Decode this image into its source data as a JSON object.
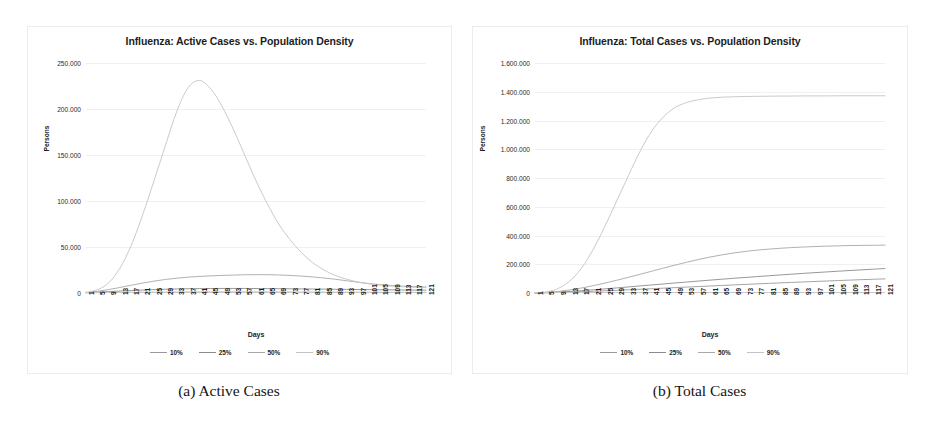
{
  "figure": {
    "panels": [
      {
        "caption": "(a) Active Cases",
        "title": "Influenza: Active Cases vs. Population Density",
        "xlabel": "Days",
        "ylabel": "Persons"
      },
      {
        "caption": "(b) Total Cases",
        "title": "Influenza: Total Cases vs. Population Density",
        "xlabel": "Days",
        "ylabel": "Persons"
      }
    ]
  },
  "legend": {
    "entries": [
      {
        "label": "10%",
        "color": "#9a9a9a"
      },
      {
        "label": "25%",
        "color": "#8c8c8c"
      },
      {
        "label": "50%",
        "color": "#a8a8a8"
      },
      {
        "label": "90%",
        "color": "#c4c4c4"
      }
    ]
  },
  "chart_data": [
    {
      "type": "line",
      "title": "Influenza: Active Cases vs. Population Density",
      "xlabel": "Days",
      "ylabel": "Persons",
      "grid": true,
      "legend_position": "bottom",
      "xlim": [
        1,
        121
      ],
      "ylim": [
        0,
        250000
      ],
      "yticks": [
        0,
        50000,
        100000,
        150000,
        200000,
        250000
      ],
      "ytick_labels": [
        "0",
        "50.000",
        "100.000",
        "150.000",
        "200.000",
        "250.000"
      ],
      "xtick_labels": [
        "1",
        "5",
        "9",
        "13",
        "17",
        "21",
        "25",
        "29",
        "33",
        "37",
        "41",
        "45",
        "49",
        "53",
        "57",
        "61",
        "65",
        "69",
        "73",
        "77",
        "81",
        "85",
        "89",
        "93",
        "97",
        "101",
        "105",
        "109",
        "113",
        "117",
        "121"
      ],
      "x": [
        1,
        5,
        9,
        13,
        17,
        21,
        25,
        29,
        33,
        37,
        41,
        45,
        49,
        53,
        57,
        61,
        65,
        69,
        73,
        77,
        81,
        85,
        89,
        93,
        97,
        101,
        105,
        109,
        113,
        117,
        121
      ],
      "series": [
        {
          "name": "10%",
          "color": "#9a9a9a",
          "values": [
            300,
            420,
            520,
            610,
            700,
            780,
            850,
            900,
            950,
            980,
            1000,
            1010,
            1020,
            1020,
            1015,
            1005,
            990,
            970,
            950,
            925,
            900,
            875,
            850,
            820,
            795,
            770,
            745,
            720,
            700,
            680,
            660
          ]
        },
        {
          "name": "25%",
          "color": "#8c8c8c",
          "values": [
            400,
            900,
            1500,
            2100,
            2700,
            3200,
            3700,
            4100,
            4400,
            4650,
            4800,
            4900,
            4950,
            4960,
            4930,
            4870,
            4790,
            4690,
            4580,
            4460,
            4330,
            4200,
            4060,
            3930,
            3800,
            3670,
            3540,
            3420,
            3300,
            3190,
            3080
          ]
        },
        {
          "name": "50%",
          "color": "#a8a8a8",
          "values": [
            500,
            1800,
            3700,
            6000,
            8500,
            10800,
            12900,
            14700,
            16100,
            17200,
            18000,
            18600,
            19100,
            19500,
            19800,
            19950,
            19900,
            19600,
            19100,
            18400,
            17500,
            16300,
            14900,
            13300,
            11700,
            10200,
            9000,
            8100,
            7400,
            6900,
            6500
          ]
        },
        {
          "name": "90%",
          "color": "#c4c4c4",
          "values": [
            800,
            3500,
            11000,
            27000,
            52000,
            85000,
            122000,
            160000,
            197000,
            223000,
            231000,
            222000,
            203000,
            178000,
            150000,
            122000,
            97000,
            75000,
            58000,
            44000,
            33000,
            25000,
            19000,
            15000,
            12000,
            10000,
            8500,
            7500,
            6800,
            6200,
            5800
          ]
        }
      ]
    },
    {
      "type": "line",
      "title": "Influenza: Total Cases vs. Population Density",
      "xlabel": "Days",
      "ylabel": "Persons",
      "grid": true,
      "legend_position": "bottom",
      "xlim": [
        1,
        121
      ],
      "ylim": [
        0,
        1600000
      ],
      "yticks": [
        0,
        200000,
        400000,
        600000,
        800000,
        1000000,
        1200000,
        1400000,
        1600000
      ],
      "ytick_labels": [
        "0",
        "200.000",
        "400.000",
        "600.000",
        "800.000",
        "1.000.000",
        "1.200.000",
        "1.400.000",
        "1.600.000"
      ],
      "xtick_labels": [
        "1",
        "5",
        "9",
        "13",
        "17",
        "21",
        "25",
        "29",
        "33",
        "37",
        "41",
        "45",
        "49",
        "53",
        "57",
        "61",
        "65",
        "69",
        "73",
        "77",
        "81",
        "85",
        "89",
        "93",
        "97",
        "101",
        "105",
        "109",
        "113",
        "117",
        "121"
      ],
      "x": [
        1,
        5,
        9,
        13,
        17,
        21,
        25,
        29,
        33,
        37,
        41,
        45,
        49,
        53,
        57,
        61,
        65,
        69,
        73,
        77,
        81,
        85,
        89,
        93,
        97,
        101,
        105,
        109,
        113,
        117,
        121
      ],
      "series": [
        {
          "name": "10%",
          "color": "#9a9a9a",
          "values": [
            300,
            1800,
            3800,
            6200,
            9000,
            12000,
            15300,
            18700,
            22300,
            26000,
            29700,
            33500,
            37300,
            41100,
            44900,
            48700,
            52400,
            56100,
            59700,
            63300,
            66800,
            70300,
            73700,
            77000,
            80300,
            83500,
            86600,
            89700,
            92700,
            95600,
            98500
          ]
        },
        {
          "name": "25%",
          "color": "#8c8c8c",
          "values": [
            400,
            2600,
            6300,
            11000,
            16400,
            22400,
            28800,
            35400,
            42200,
            49100,
            56000,
            62900,
            69700,
            76400,
            83000,
            89500,
            95800,
            102000,
            108000,
            114000,
            119800,
            125500,
            131000,
            136400,
            141600,
            146700,
            151700,
            156500,
            161200,
            165800,
            170300
          ]
        },
        {
          "name": "50%",
          "color": "#a8a8a8",
          "values": [
            500,
            4200,
            11000,
            21500,
            35000,
            51000,
            69000,
            88500,
            109000,
            130000,
            151500,
            173000,
            194000,
            214000,
            233000,
            250000,
            265000,
            278000,
            289000,
            298000,
            305000,
            311000,
            316000,
            320000,
            323000,
            326000,
            328000,
            330000,
            331000,
            332000,
            333000
          ]
        },
        {
          "name": "90%",
          "color": "#c4c4c4",
          "values": [
            1000,
            8000,
            32000,
            85000,
            175000,
            305000,
            465000,
            640000,
            815000,
            985000,
            1125000,
            1225000,
            1290000,
            1325000,
            1345000,
            1356000,
            1362000,
            1365000,
            1367000,
            1368000,
            1369000,
            1370000,
            1370000,
            1371000,
            1371000,
            1371000,
            1372000,
            1372000,
            1372000,
            1372000,
            1372000
          ]
        }
      ]
    }
  ]
}
